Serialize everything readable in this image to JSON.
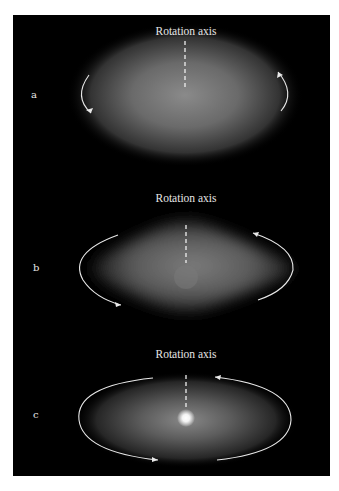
{
  "figure": {
    "background_color": "#000000",
    "page_color": "#ffffff",
    "panels": [
      {
        "label": "a",
        "axis_label": "Rotation axis",
        "shape": "ellipsoidal (slightly flattened)",
        "arrows": "short arcs at left and right edges"
      },
      {
        "label": "b",
        "axis_label": "Rotation axis",
        "shape": "flattened diamond/lens with faint central bulge",
        "arrows": "elliptical arcs around galaxy"
      },
      {
        "label": "c",
        "axis_label": "Rotation axis",
        "shape": "flattened ellipse with bright central nucleus",
        "arrows": "elliptical orbit arcs around galaxy"
      }
    ]
  }
}
